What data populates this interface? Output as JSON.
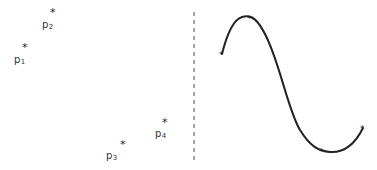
{
  "diagram": {
    "left_panel": {
      "points": [
        {
          "id": "p1",
          "marker": "*",
          "label_base": "p",
          "label_sub": "1",
          "x": 25,
          "y": 47
        },
        {
          "id": "p2",
          "marker": "*",
          "label_base": "p",
          "label_sub": "2",
          "x": 53,
          "y": 12
        },
        {
          "id": "p3",
          "marker": "*",
          "label_base": "p",
          "label_sub": "3",
          "x": 123,
          "y": 143
        },
        {
          "id": "p4",
          "marker": "*",
          "label_base": "p",
          "label_sub": "4",
          "x": 165,
          "y": 122
        }
      ]
    },
    "divider": {
      "style": "dashed",
      "x": 194,
      "y_top": 12,
      "y_bottom": 162,
      "color": "#666666"
    },
    "right_panel": {
      "curve": {
        "type": "smooth-spline",
        "color": "#222222",
        "knots": [
          {
            "x": 222,
            "y": 54
          },
          {
            "x": 250,
            "y": 18
          },
          {
            "x": 322,
            "y": 150
          },
          {
            "x": 363,
            "y": 128
          }
        ]
      }
    }
  }
}
